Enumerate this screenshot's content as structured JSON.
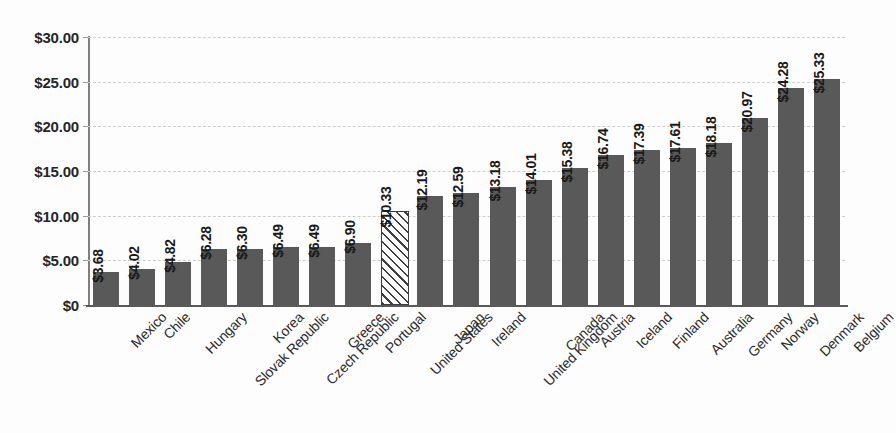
{
  "chart_data": {
    "type": "bar",
    "title": "",
    "subtitle": "",
    "xlabel": "",
    "ylabel": "",
    "ylim": [
      0,
      30
    ],
    "grid": true,
    "legend_position": "none",
    "orientation": "vertical",
    "sorted": "ascending",
    "value_prefix": "$",
    "categories": [
      "Mexico",
      "Chile",
      "Hungary",
      "Slovak Republic",
      "Korea",
      "Czech Republic",
      "Greece",
      "Portugal",
      "United States",
      "Japan",
      "Ireland",
      "United Kingdom",
      "Canada",
      "Austria",
      "Iceland",
      "Finland",
      "Australia",
      "Germany",
      "Norway",
      "Denmark",
      "Belgium"
    ],
    "values": [
      3.68,
      4.02,
      4.82,
      6.28,
      6.3,
      6.49,
      6.49,
      6.9,
      10.33,
      12.19,
      12.59,
      13.18,
      14.01,
      15.38,
      16.74,
      17.39,
      17.61,
      18.18,
      20.97,
      24.28,
      25.33
    ],
    "data_labels": [
      "$3.68",
      "$4.02",
      "$4.82",
      "$6.28",
      "$6.30",
      "$6.49",
      "$6.49",
      "$6.90",
      "$10.33",
      "$12.19",
      "$12.59",
      "$13.18",
      "$14.01",
      "$15.38",
      "$16.74",
      "$17.39",
      "$17.61",
      "$18.18",
      "$20.97",
      "$24.28",
      "$25.33"
    ],
    "highlighted_category": "United States",
    "highlighted_index": 8,
    "highlight_style": "diagonal-hatch",
    "yticks": [
      0,
      5,
      10,
      15,
      20,
      25,
      30
    ],
    "ytick_labels": [
      "$0",
      "$5.00",
      "$10.00",
      "$15.00",
      "$20.00",
      "$25.00",
      "$30.00"
    ]
  },
  "style": {
    "bar_color": "#595959",
    "highlight_fill": "#ffffff",
    "highlight_outline": "#3f3f3f",
    "gridline_color": "#cfcfcf",
    "axis_color": "#7f7f7f",
    "baseline_color": "#595959",
    "background": "#fdfdfd",
    "text_color": "#1a1a1a"
  }
}
